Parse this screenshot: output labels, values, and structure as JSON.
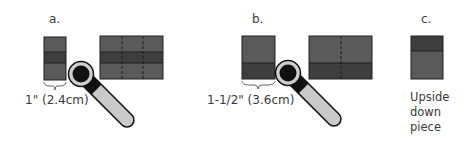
{
  "colors": {
    "fabric_light": "#5a5a5a",
    "fabric_dark": "#3e3e3e",
    "outline": "#1e1e1e",
    "cutter_body": "#111111",
    "cutter_ring": "#cfcfcf",
    "cutter_handle": "#c9c9c9",
    "text": "#3a3a3a"
  },
  "panels": [
    {
      "id": "a",
      "label": "a.",
      "measurement": "1\" (2.4cm)",
      "strip_bands": [
        "light",
        "dark",
        "light"
      ],
      "block_bands": [
        "light",
        "dark",
        "light"
      ],
      "block_dashed_columns": 2
    },
    {
      "id": "b",
      "label": "b.",
      "measurement": "1-1/2\" (3.6cm)",
      "strip_bands": [
        "light",
        "dark"
      ],
      "block_bands": [
        "light",
        "dark"
      ],
      "block_dashed_columns": 1
    },
    {
      "id": "c",
      "label": "c.",
      "strip_bands": [
        "dark",
        "light"
      ],
      "caption_lines": [
        "Upside",
        "down",
        "piece"
      ]
    }
  ],
  "icons": [
    "rotary-cutter-icon",
    "brace-icon"
  ]
}
